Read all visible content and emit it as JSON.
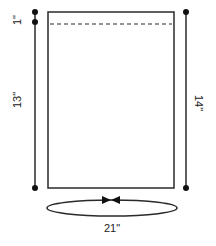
{
  "diagram": {
    "type": "sewing-pattern-measurement",
    "colors": {
      "stroke": "#2a2a2a",
      "background": "#ffffff",
      "text": "#222222"
    },
    "panel": {
      "shape": "rectangle",
      "fold_line": "dashed"
    },
    "measurements": {
      "top_allowance": "1\"",
      "left_height": "13\"",
      "right_height": "14\"",
      "circumference": "21\""
    }
  }
}
